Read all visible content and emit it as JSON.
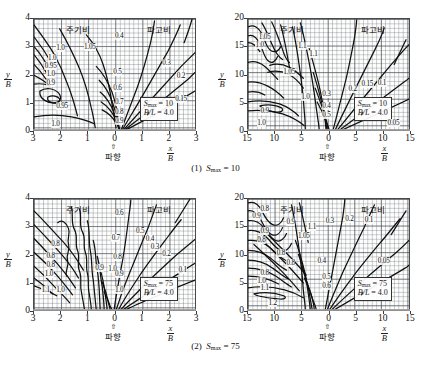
{
  "figure": {
    "bottom_note": "",
    "axis": {
      "x_numerator": "x",
      "x_denominator": "B",
      "y_numerator": "y",
      "y_denominator": "B"
    },
    "korean": {
      "period_ratio": "주기비",
      "wave_height_ratio": "파고비",
      "wave_direction": "파향",
      "wave_direction_arrow": "⇧"
    }
  },
  "captions": [
    {
      "index": "(1)",
      "symbol": "S",
      "sub": "max",
      "eq": "= 10"
    },
    {
      "index": "(2)",
      "symbol": "S",
      "sub": "max",
      "eq": "= 75"
    }
  ],
  "panels": [
    {
      "id": "p1",
      "row": 1,
      "col": "left",
      "legend": {
        "s_symbol": "S",
        "s_sub": "max",
        "s_value": "= 10",
        "bl_label": "B/L",
        "bl_value": "= 4.0"
      },
      "x_ticks": [
        "3",
        "2",
        "1",
        "0",
        "1",
        "2",
        "3"
      ],
      "y_ticks": [
        "0",
        "1",
        "2",
        "3",
        "4"
      ],
      "x_range": [
        -3,
        3
      ],
      "y_range": [
        0,
        4
      ],
      "contour_labels": [
        {
          "t": "1.0",
          "x": 14,
          "y": 23
        },
        {
          "t": "1.05",
          "x": 31,
          "y": 22
        },
        {
          "t": "1.0",
          "x": 9,
          "y": 32
        },
        {
          "t": "0.95",
          "x": 7,
          "y": 39
        },
        {
          "t": "1.0",
          "x": 8,
          "y": 46
        },
        {
          "t": "0.9",
          "x": 8,
          "y": 54
        },
        {
          "t": "0.95",
          "x": 14,
          "y": 74
        },
        {
          "t": "1.0",
          "x": 11,
          "y": 90
        },
        {
          "t": "0.4",
          "x": 50,
          "y": 12
        },
        {
          "t": "0.5",
          "x": 49,
          "y": 44
        },
        {
          "t": "0.6",
          "x": 49,
          "y": 58
        },
        {
          "t": "0.7",
          "x": 50,
          "y": 71
        },
        {
          "t": "0.8",
          "x": 50,
          "y": 80
        },
        {
          "t": "0.9",
          "x": 50,
          "y": 88
        },
        {
          "t": "0.3",
          "x": 79,
          "y": 36
        },
        {
          "t": "0.2",
          "x": 88,
          "y": 48
        },
        {
          "t": "0.15",
          "x": 87,
          "y": 68
        }
      ]
    },
    {
      "id": "p2",
      "row": 1,
      "col": "right",
      "legend": {
        "s_symbol": "S",
        "s_sub": "max",
        "s_value": "= 10",
        "bl_label": "B/L",
        "bl_value": "= 4.0"
      },
      "x_ticks": [
        "15",
        "10",
        "5",
        "0",
        "5",
        "10",
        "15"
      ],
      "y_ticks": [
        "0",
        "5",
        "10",
        "15",
        "20"
      ],
      "x_range": [
        -15,
        15
      ],
      "y_range": [
        0,
        20
      ],
      "contour_labels": [
        {
          "t": "1.05",
          "x": 7,
          "y": 13
        },
        {
          "t": "1.0",
          "x": 5,
          "y": 20
        },
        {
          "t": "1.1",
          "x": 31,
          "y": 21
        },
        {
          "t": "1.1",
          "x": 38,
          "y": 28
        },
        {
          "t": "1.05",
          "x": 22,
          "y": 44
        },
        {
          "t": "1.0",
          "x": 33,
          "y": 66
        },
        {
          "t": "0.9",
          "x": 8,
          "y": 79
        },
        {
          "t": "1.0",
          "x": 6,
          "y": 89
        },
        {
          "t": "0.3",
          "x": 46,
          "y": 64
        },
        {
          "t": "0.4",
          "x": 46,
          "y": 74
        },
        {
          "t": "0.5",
          "x": 46,
          "y": 82
        },
        {
          "t": "0.2",
          "x": 62,
          "y": 59
        },
        {
          "t": "0.15",
          "x": 70,
          "y": 55
        },
        {
          "t": "0.1",
          "x": 80,
          "y": 54
        },
        {
          "t": "0.05",
          "x": 86,
          "y": 89
        }
      ]
    },
    {
      "id": "p3",
      "row": 2,
      "col": "left",
      "legend": {
        "s_symbol": "S",
        "s_sub": "max",
        "s_value": "= 75",
        "bl_label": "B/L",
        "bl_value": "= 4.0"
      },
      "x_ticks": [
        "3",
        "2",
        "1",
        "0",
        "1",
        "2",
        "3"
      ],
      "y_ticks": [
        "0",
        "1",
        "2",
        "3",
        "4"
      ],
      "x_range": [
        -3,
        3
      ],
      "y_range": [
        0,
        4
      ],
      "contour_labels": [
        {
          "t": "0.8",
          "x": 11,
          "y": 37
        },
        {
          "t": "0.8",
          "x": 8,
          "y": 48
        },
        {
          "t": "0.8",
          "x": 8,
          "y": 56
        },
        {
          "t": "1.0",
          "x": 7,
          "y": 64
        },
        {
          "t": "1.1",
          "x": 5,
          "y": 78
        },
        {
          "t": "1.0",
          "x": 14,
          "y": 78
        },
        {
          "t": "0.9",
          "x": 38,
          "y": 58
        },
        {
          "t": "1.0",
          "x": 46,
          "y": 59
        },
        {
          "t": "0.6",
          "x": 50,
          "y": 10
        },
        {
          "t": "0.7",
          "x": 48,
          "y": 32
        },
        {
          "t": "0.8",
          "x": 49,
          "y": 49
        },
        {
          "t": "0.9",
          "x": 50,
          "y": 64
        },
        {
          "t": "1.0",
          "x": 50,
          "y": 78
        },
        {
          "t": "0.5",
          "x": 63,
          "y": 26
        },
        {
          "t": "0.4",
          "x": 69,
          "y": 33
        },
        {
          "t": "0.3",
          "x": 72,
          "y": 40
        },
        {
          "t": "0.2",
          "x": 79,
          "y": 46
        },
        {
          "t": "0.1",
          "x": 89,
          "y": 60
        }
      ]
    },
    {
      "id": "p4",
      "row": 2,
      "col": "right",
      "legend": {
        "s_symbol": "S",
        "s_sub": "max",
        "s_value": "= 75",
        "bl_label": "B/L",
        "bl_value": "= 4.0"
      },
      "x_ticks": [
        "15",
        "10",
        "5",
        "0",
        "5",
        "10",
        "15"
      ],
      "y_ticks": [
        "0",
        "5",
        "10",
        "15",
        "20"
      ],
      "x_range": [
        -15,
        15
      ],
      "y_range": [
        0,
        20
      ],
      "contour_labels": [
        {
          "t": "0.8",
          "x": 8,
          "y": 6
        },
        {
          "t": "0.9",
          "x": 3,
          "y": 12
        },
        {
          "t": "0.9",
          "x": 24,
          "y": 18
        },
        {
          "t": "0.9",
          "x": 8,
          "y": 26
        },
        {
          "t": "1.1",
          "x": 37,
          "y": 22
        },
        {
          "t": "1.05",
          "x": 31,
          "y": 30
        },
        {
          "t": "0.8",
          "x": 6,
          "y": 34
        },
        {
          "t": "0.8",
          "x": 18,
          "y": 45
        },
        {
          "t": "0.8",
          "x": 24,
          "y": 54
        },
        {
          "t": "0.8",
          "x": 8,
          "y": 63
        },
        {
          "t": "1.0",
          "x": 6,
          "y": 70
        },
        {
          "t": "1.1",
          "x": 8,
          "y": 76
        },
        {
          "t": "1.2",
          "x": 13,
          "y": 89
        },
        {
          "t": "0.4",
          "x": 43,
          "y": 52
        },
        {
          "t": "0.5",
          "x": 46,
          "y": 66
        },
        {
          "t": "0.6",
          "x": 46,
          "y": 74
        },
        {
          "t": "0.3",
          "x": 48,
          "y": 17
        },
        {
          "t": "0.2",
          "x": 60,
          "y": 15
        },
        {
          "t": "0.1",
          "x": 72,
          "y": 16
        },
        {
          "t": "0.05",
          "x": 80,
          "y": 52
        }
      ]
    }
  ]
}
